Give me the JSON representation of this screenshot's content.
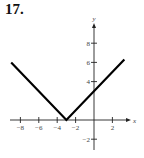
{
  "problem": {
    "number": "17."
  },
  "colors": {
    "curve": "#000000",
    "axis": "#222222",
    "text": "#444444"
  },
  "chart_data": {
    "type": "line",
    "title": "",
    "function": "y = |x + 3|",
    "xlabel": "x",
    "ylabel": "y",
    "xlim": [
      -9,
      3.5
    ],
    "ylim": [
      -3,
      10
    ],
    "grid": false,
    "legend": null,
    "x_ticks": [
      -8,
      -6,
      -4,
      -2,
      2
    ],
    "x_tick_labels": [
      "−8",
      "−6",
      "−4",
      "−2",
      "2"
    ],
    "y_ticks": [
      8,
      6,
      4,
      -2
    ],
    "y_tick_labels": [
      "8",
      "6",
      "4",
      "−2"
    ],
    "series": [
      {
        "name": "y = |x + 3|",
        "x": [
          -9,
          -3,
          3.3
        ],
        "y": [
          6,
          0,
          6.3
        ]
      }
    ],
    "vertex": [
      -3,
      0
    ]
  }
}
